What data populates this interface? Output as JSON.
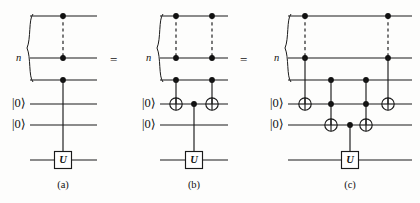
{
  "figure": {
    "background_color": "#fdfdfc",
    "line_color": "#1a1a1a",
    "equality_symbol_1": "=",
    "equality_symbol_2": "=",
    "panels": [
      {
        "id": "a",
        "caption": "(a)",
        "register_label": "n",
        "ancilla_labels": [
          "|0⟩",
          "|0⟩"
        ],
        "gate_label": "U",
        "description": "n-controlled U gate acting on the target wire, ancillas unused"
      },
      {
        "id": "b",
        "caption": "(b)",
        "register_label": "n",
        "ancilla_labels": [
          "|0⟩",
          "|0⟩"
        ],
        "gate_label": "U",
        "description": "Decomposition with two multi-controlled NOT gates onto the first ancilla and a singly-controlled U"
      },
      {
        "id": "c",
        "caption": "(c)",
        "register_label": "n",
        "ancilla_labels": [
          "|0⟩",
          "|0⟩"
        ],
        "gate_label": "U",
        "description": "Full decomposition into four Toffoli gates and a singly-controlled U"
      }
    ],
    "icons": {
      "control_dot": "control-dot-icon",
      "target_cross": "not-target-icon",
      "dashed_register": "dashed-register-icon",
      "register_brace": "curly-brace-icon"
    }
  },
  "chart_data": {
    "type": "diagram",
    "wire_y": [
      16,
      58,
      80,
      104,
      125,
      160
    ],
    "wire_names": [
      "ctrl-1",
      "ctrl-2",
      "ctrl-3",
      "ancilla-1",
      "ancilla-2",
      "target"
    ],
    "panels": [
      {
        "id": "a",
        "x_start": 30,
        "x_end": 97,
        "caption_x": 63,
        "brace_x": 28,
        "n_label_x": 16,
        "ket_x": [
          12,
          12
        ],
        "elements": [
          {
            "kind": "dashed",
            "x": 63,
            "from_wire": 0,
            "to_wire": 1
          },
          {
            "kind": "control",
            "x": 63,
            "wire": 0
          },
          {
            "kind": "control",
            "x": 63,
            "wire": 1
          },
          {
            "kind": "control",
            "x": 63,
            "wire": 2
          },
          {
            "kind": "vline",
            "x": 63,
            "from_wire": 2,
            "to_wire": 5
          },
          {
            "kind": "gate",
            "x": 63,
            "wire": 5,
            "label": "U"
          }
        ]
      },
      {
        "id": "b",
        "x_start": 160,
        "x_end": 228,
        "caption_x": 194,
        "brace_x": 158,
        "n_label_x": 146,
        "ket_x": [
          142,
          142
        ],
        "elements": [
          {
            "kind": "dashed",
            "x": 176,
            "from_wire": 0,
            "to_wire": 1
          },
          {
            "kind": "dashed",
            "x": 212,
            "from_wire": 0,
            "to_wire": 1
          },
          {
            "kind": "control",
            "x": 176,
            "wire": 0
          },
          {
            "kind": "control",
            "x": 176,
            "wire": 1
          },
          {
            "kind": "control",
            "x": 176,
            "wire": 2
          },
          {
            "kind": "target",
            "x": 176,
            "wire": 3
          },
          {
            "kind": "vline",
            "x": 176,
            "from_wire": 2,
            "to_wire": 3
          },
          {
            "kind": "control",
            "x": 212,
            "wire": 0
          },
          {
            "kind": "control",
            "x": 212,
            "wire": 1
          },
          {
            "kind": "control",
            "x": 212,
            "wire": 2
          },
          {
            "kind": "target",
            "x": 212,
            "wire": 3
          },
          {
            "kind": "vline",
            "x": 212,
            "from_wire": 2,
            "to_wire": 3
          },
          {
            "kind": "control",
            "x": 194,
            "wire": 3
          },
          {
            "kind": "vline",
            "x": 194,
            "from_wire": 3,
            "to_wire": 5
          },
          {
            "kind": "gate",
            "x": 194,
            "wire": 5,
            "label": "U"
          }
        ]
      },
      {
        "id": "c",
        "x_start": 288,
        "x_end": 412,
        "caption_x": 350,
        "brace_x": 286,
        "n_label_x": 274,
        "ket_x": [
          270,
          270
        ],
        "elements": [
          {
            "kind": "dashed",
            "x": 305,
            "from_wire": 0,
            "to_wire": 1
          },
          {
            "kind": "dashed",
            "x": 388,
            "from_wire": 0,
            "to_wire": 1
          },
          {
            "kind": "control",
            "x": 305,
            "wire": 0
          },
          {
            "kind": "control",
            "x": 305,
            "wire": 1
          },
          {
            "kind": "target",
            "x": 305,
            "wire": 3
          },
          {
            "kind": "vline",
            "x": 305,
            "from_wire": 1,
            "to_wire": 3
          },
          {
            "kind": "control",
            "x": 388,
            "wire": 0
          },
          {
            "kind": "control",
            "x": 388,
            "wire": 1
          },
          {
            "kind": "target",
            "x": 388,
            "wire": 3
          },
          {
            "kind": "vline",
            "x": 388,
            "from_wire": 1,
            "to_wire": 3
          },
          {
            "kind": "control",
            "x": 331,
            "wire": 2
          },
          {
            "kind": "control",
            "x": 331,
            "wire": 3
          },
          {
            "kind": "target",
            "x": 331,
            "wire": 4
          },
          {
            "kind": "vline",
            "x": 331,
            "from_wire": 2,
            "to_wire": 4
          },
          {
            "kind": "control",
            "x": 366,
            "wire": 2
          },
          {
            "kind": "control",
            "x": 366,
            "wire": 3
          },
          {
            "kind": "target",
            "x": 366,
            "wire": 4
          },
          {
            "kind": "vline",
            "x": 366,
            "from_wire": 2,
            "to_wire": 4
          },
          {
            "kind": "control",
            "x": 350,
            "wire": 4
          },
          {
            "kind": "vline",
            "x": 350,
            "from_wire": 4,
            "to_wire": 5
          },
          {
            "kind": "gate",
            "x": 350,
            "wire": 5,
            "label": "U"
          }
        ]
      }
    ],
    "equals": [
      {
        "label": "=",
        "x": 110,
        "y": 60
      },
      {
        "label": "=",
        "x": 240,
        "y": 60
      }
    ]
  }
}
